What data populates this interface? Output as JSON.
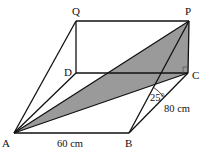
{
  "diagram": {
    "type": "3D cuboid with shaded triangle",
    "shaded_fill": "#9a9a9a",
    "line_color": "#111111",
    "points": {
      "A": {
        "label": "A",
        "x": 14,
        "y": 133
      },
      "B": {
        "label": "B",
        "x": 129,
        "y": 133
      },
      "C": {
        "label": "C",
        "x": 188,
        "y": 73
      },
      "D": {
        "label": "D",
        "x": 76,
        "y": 73
      },
      "P": {
        "label": "P",
        "x": 189,
        "y": 21
      },
      "Q": {
        "label": "Q",
        "x": 76,
        "y": 21
      }
    },
    "measurements": {
      "ab": "60 cm",
      "bc": "80 cm",
      "angle": "25°"
    }
  }
}
